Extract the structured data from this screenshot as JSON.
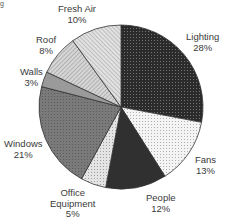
{
  "chart_data": {
    "type": "pie",
    "title_fragment": "g",
    "start_angle_deg": 0,
    "direction": "clockwise",
    "slices": [
      {
        "label": "Lighting",
        "pct_label": "28%",
        "value": 28,
        "color": "#2b2b2b",
        "pattern": "dots-light"
      },
      {
        "label": "Fans",
        "pct_label": "13%",
        "value": 13,
        "color": "#f2f2f2",
        "pattern": "dots-dark"
      },
      {
        "label": "People",
        "pct_label": "12%",
        "value": 12,
        "color": "#303030",
        "pattern": "none"
      },
      {
        "label": "Office Equipment",
        "pct_label": "5%",
        "value": 5,
        "color": "#e4e4e4",
        "pattern": "dots-dark"
      },
      {
        "label": "Windows",
        "pct_label": "21%",
        "value": 21,
        "color": "#7a7a7a",
        "pattern": "grid"
      },
      {
        "label": "Walls",
        "pct_label": "3%",
        "value": 3,
        "color": "#9a9a9a",
        "pattern": "none"
      },
      {
        "label": "Roof",
        "pct_label": "8%",
        "value": 8,
        "color": "#cfcfcf",
        "pattern": "hatch"
      },
      {
        "label": "Fresh Air",
        "pct_label": "10%",
        "value": 10,
        "color": "#dedede",
        "pattern": "hatch"
      }
    ]
  },
  "labels": {
    "lighting": {
      "name": "Lighting",
      "pct": "28%"
    },
    "fans": {
      "name": "Fans",
      "pct": "13%"
    },
    "people": {
      "name": "People",
      "pct": "12%"
    },
    "office": {
      "name1": "Office",
      "name2": "Equipment",
      "pct": "5%"
    },
    "windows": {
      "name": "Windows",
      "pct": "21%"
    },
    "walls": {
      "name": "Walls",
      "pct": "3%"
    },
    "roof": {
      "name": "Roof",
      "pct": "8%"
    },
    "fresh_air": {
      "name": "Fresh Air",
      "pct": "10%"
    }
  }
}
